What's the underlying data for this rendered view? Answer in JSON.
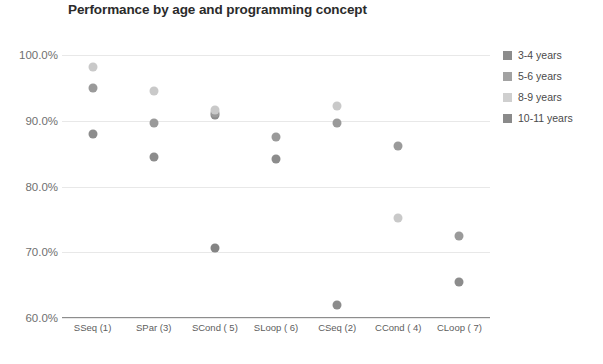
{
  "chart_data": {
    "type": "scatter",
    "title": "Performance by age and programming concept",
    "xlabel": "",
    "ylabel": "",
    "ylim": [
      60,
      100
    ],
    "yticks": [
      60,
      70,
      80,
      90,
      100
    ],
    "ytick_labels": [
      "60.0%",
      "70.0%",
      "80.0%",
      "90.0%",
      "100.0%"
    ],
    "grid": true,
    "legend_position": "right",
    "categories": [
      "SSeq (1)",
      "SPar (3)",
      "SCond ( 5)",
      "SLoop ( 6)",
      "CSeq (2)",
      "CCond ( 4)",
      "CLoop ( 7)"
    ],
    "series": [
      {
        "name": "3-4 years",
        "color": "#8c8c8c",
        "values": [
          88.0,
          84.5,
          90.8,
          84.2,
          62.0,
          null,
          65.5
        ]
      },
      {
        "name": "5-6 years",
        "color": "#9a9a9a",
        "values": [
          95.0,
          89.6,
          91.2,
          87.6,
          89.7,
          86.2,
          72.5
        ]
      },
      {
        "name": "8-9 years",
        "color": "#c9c9c9",
        "values": [
          98.2,
          94.5,
          91.6,
          null,
          92.3,
          75.2,
          null
        ]
      },
      {
        "name": "10-11 years",
        "color": "#848484",
        "values": [
          null,
          null,
          70.7,
          null,
          null,
          null,
          null
        ]
      }
    ]
  },
  "legend": {
    "items": [
      {
        "label": "3-4 years",
        "color": "#8c8c8c"
      },
      {
        "label": "5-6 years",
        "color": "#a2a2a2"
      },
      {
        "label": "8-9 years",
        "color": "#cfcfcf"
      },
      {
        "label": "10-11 years",
        "color": "#8a8a8a"
      }
    ]
  }
}
